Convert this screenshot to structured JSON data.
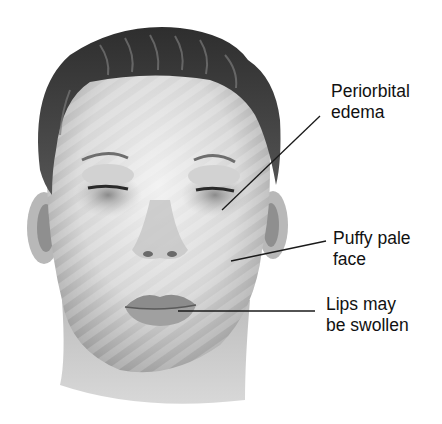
{
  "figure": {
    "colors": {
      "background": "#ffffff",
      "hair": "#3a3a3a",
      "skin_light": "#e6e6e6",
      "skin_shadow": "#9a9a9a",
      "lips": "#8a8a8a",
      "leader_line": "#1a1a1a",
      "text": "#111111"
    }
  },
  "annotations": [
    {
      "id": "periorbital",
      "line1": "Periorbital",
      "line2": "edema"
    },
    {
      "id": "puffy",
      "line1": "Puffy pale",
      "line2": "face"
    },
    {
      "id": "lips",
      "line1": "Lips may",
      "line2": "be swollen"
    }
  ]
}
